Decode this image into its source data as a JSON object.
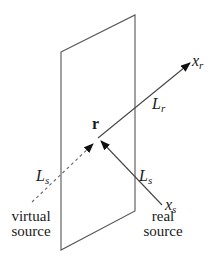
{
  "diagram": {
    "plane_points": "61,52 135,15 135,211 61,250",
    "colors": {
      "stroke": "#555555",
      "text": "#1a1a1a",
      "arrow": "#111111"
    },
    "point_r": {
      "label": "r"
    },
    "labels": {
      "x_r": {
        "main": "x",
        "sub": "r"
      },
      "L_r": {
        "main": "L",
        "sub": "r"
      },
      "L_s_left": {
        "main": "L",
        "sub": "s"
      },
      "L_s_right": {
        "main": "L",
        "sub": "s"
      },
      "x_s": {
        "main": "x",
        "sub": "s"
      }
    },
    "captions": {
      "virtual_source": [
        "virtual",
        "source"
      ],
      "real_source": [
        "real",
        "source"
      ]
    }
  }
}
